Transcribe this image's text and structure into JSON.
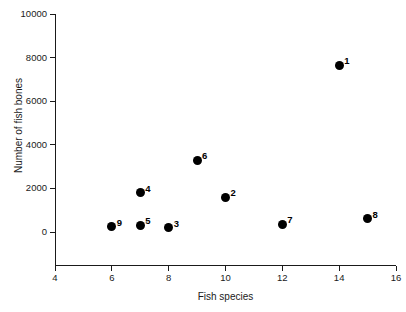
{
  "chart_data": {
    "type": "scatter",
    "title": "",
    "xlabel": "Fish species",
    "ylabel": "Number of fish bones",
    "xlim": [
      4,
      16
    ],
    "ylim": [
      0,
      10000
    ],
    "xticks": [
      "4",
      "6",
      "8",
      "10",
      "12",
      "14",
      "16"
    ],
    "xtick_values": [
      4,
      6,
      8,
      10,
      12,
      14,
      16
    ],
    "yticks": [
      "0",
      "2000",
      "4000",
      "6000",
      "8000",
      "10000"
    ],
    "ytick_values": [
      0,
      2000,
      4000,
      6000,
      8000,
      10000
    ],
    "grid": false,
    "legend": null,
    "marker_color": "#000000",
    "axis_color": "#1a1a1a",
    "points": [
      {
        "label": "1",
        "x": 14,
        "y": 7650
      },
      {
        "label": "2",
        "x": 10,
        "y": 1600
      },
      {
        "label": "3",
        "x": 8,
        "y": 200
      },
      {
        "label": "4",
        "x": 7,
        "y": 1800
      },
      {
        "label": "5",
        "x": 7,
        "y": 300
      },
      {
        "label": "6",
        "x": 9,
        "y": 3300
      },
      {
        "label": "7",
        "x": 12,
        "y": 350
      },
      {
        "label": "8",
        "x": 15,
        "y": 600
      },
      {
        "label": "9",
        "x": 6,
        "y": 250
      }
    ]
  }
}
